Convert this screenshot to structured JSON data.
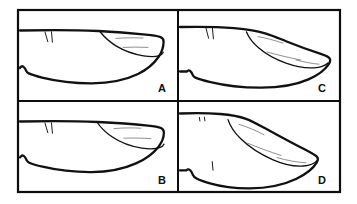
{
  "figure": {
    "background_color": "#ffffff",
    "ink_color": "#111111",
    "shade_color": "#6b6b6b",
    "frame": {
      "stroke_color": "#0d0d0d",
      "stroke_width": 2.2,
      "x": 18,
      "y": 10,
      "width": 322,
      "height": 182
    },
    "grid": {
      "rows": 2,
      "columns": 2,
      "vertical_divider_x": 178,
      "horizontal_divider_y": 101
    },
    "panels": [
      {
        "id": "panel-a",
        "label": "A",
        "label_x": 166,
        "label_y": 92,
        "position": "top-left",
        "shape_note": "elongate, broadly rounded apex, shallow inner crescent, small basal tooth on ventral margin",
        "setae_count": 2
      },
      {
        "id": "panel-b",
        "label": "B",
        "label_x": 166,
        "label_y": 184,
        "position": "bottom-left",
        "shape_note": "elongate, rounded apex, longer inner crescent reaching further basad, small basal tooth",
        "setae_count": 2
      },
      {
        "id": "panel-c",
        "label": "C",
        "label_x": 326,
        "label_y": 92,
        "position": "top-right",
        "shape_note": "tapering, dorsal margin sloping, narrow elongate inner wedge, subacute apex",
        "setae_count": 2
      },
      {
        "id": "panel-d",
        "label": "D",
        "label_x": 326,
        "label_y": 184,
        "position": "bottom-right",
        "shape_note": "strongly tapering, acute apex, very long narrow inner wedge, stepped ventral margin with spine",
        "setae_count": 2
      }
    ]
  }
}
